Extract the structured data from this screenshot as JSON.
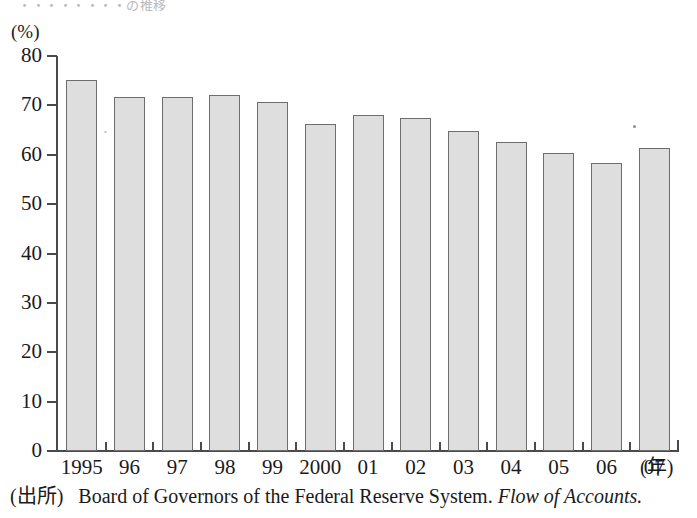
{
  "page": {
    "top_fragment": "・・・・・・・・の推移",
    "background_color": "#ffffff"
  },
  "chart_data": {
    "type": "bar",
    "title": "",
    "xlabel": "(年)",
    "ylabel": "(%)",
    "categories": [
      "1995",
      "96",
      "97",
      "98",
      "99",
      "2000",
      "01",
      "02",
      "03",
      "04",
      "05",
      "06",
      "07"
    ],
    "values": [
      75.2,
      71.6,
      71.6,
      72.1,
      70.6,
      66.2,
      68.0,
      67.4,
      64.9,
      62.5,
      60.4,
      58.3,
      61.3
    ],
    "ylim": [
      0,
      80
    ],
    "ytick_step": 10,
    "yticks": [
      "0",
      "10",
      "20",
      "30",
      "40",
      "50",
      "60",
      "70",
      "80"
    ],
    "grid": false,
    "legend": null,
    "bar_fill_color": "#dedede",
    "bar_border_color": "#6d6d6d",
    "axis_color": "#4a4a4a"
  },
  "source": {
    "label": "(出所)",
    "text": "Board of Governors of the Federal Reserve System.",
    "italic_text": "Flow of Accounts."
  }
}
